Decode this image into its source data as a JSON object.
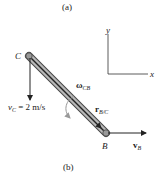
{
  "captions": {
    "top": "(a)",
    "bottom": "(b)"
  },
  "axes": {
    "x_label": "x",
    "y_label": "y"
  },
  "points": {
    "C": "C",
    "B": "B"
  },
  "labels": {
    "vc_main": "v",
    "vc_sub": "C",
    "vc_value": " = 2 m/s",
    "omega_main": "ω",
    "omega_sub": "CB",
    "r_main": "r",
    "r_sub": "B/C",
    "vb_main": "v",
    "vb_sub": "B"
  },
  "colors": {
    "rod_fill": "#b0b0b0",
    "rod_edge": "#333333",
    "rod_core": "#222222",
    "arrow": "#222222",
    "omega_arrow": "#999999"
  }
}
